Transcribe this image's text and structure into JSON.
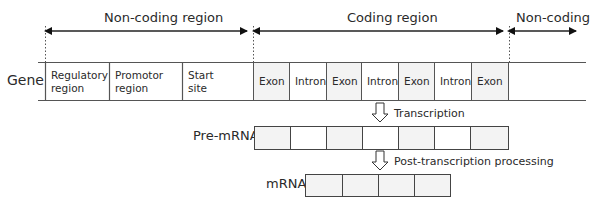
{
  "regions": {
    "non_coding_left": "Non-coding region",
    "coding": "Coding region",
    "non_coding_right": "Non-coding"
  },
  "gene": {
    "label": "Gene",
    "segments": [
      {
        "type": "regulatory",
        "line1": "Regulatory",
        "line2": "region"
      },
      {
        "type": "promotor",
        "line1": "Promotor",
        "line2": "region"
      },
      {
        "type": "start",
        "line1": "Start",
        "line2": "site"
      },
      {
        "type": "exon",
        "label": "Exon"
      },
      {
        "type": "intron",
        "label": "Intron"
      },
      {
        "type": "exon",
        "label": "Exon"
      },
      {
        "type": "intron",
        "label": "Intron"
      },
      {
        "type": "exon",
        "label": "Exon"
      },
      {
        "type": "intron",
        "label": "Intron"
      },
      {
        "type": "exon",
        "label": "Exon"
      }
    ]
  },
  "steps": {
    "transcription": "Transcription",
    "post_processing": "Post-transcription processing"
  },
  "pre_mrna": {
    "label": "Pre-mRNA",
    "segments": [
      "exon",
      "intron",
      "exon",
      "intron",
      "exon",
      "intron",
      "exon"
    ]
  },
  "mrna": {
    "label": "mRNA",
    "segments": [
      "exon",
      "exon",
      "exon",
      "exon"
    ]
  },
  "colors": {
    "exon_fill": "#f3f3f3",
    "intron_fill": "#ffffff",
    "line": "#444444"
  }
}
